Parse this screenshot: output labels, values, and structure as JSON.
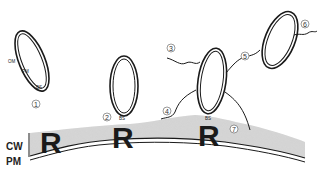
{
  "diagram": {
    "type": "biological schematic",
    "layers": {
      "cell_wall_label": "CW",
      "plasma_membrane_label": "PM"
    },
    "receptor_label": "R",
    "bacterium_layer_labels": {
      "outer_membrane": "OM",
      "plasma_membrane": "PM",
      "binding_site": "BS"
    },
    "binding_site_label": "BS",
    "stage_numbers": [
      "1",
      "2",
      "3",
      "4",
      "5",
      "6",
      "7"
    ],
    "stages": [
      {
        "number": "1",
        "description": "free bacterium with OM, PM, BS labelled"
      },
      {
        "number": "2",
        "description": "bacterium attached to receptor via binding site"
      },
      {
        "number": "3",
        "description": "fibril extending from attached bacterium"
      },
      {
        "number": "4",
        "description": "fibril anchoring to cell wall surface"
      },
      {
        "number": "5",
        "description": "fibril linking two bacteria"
      },
      {
        "number": "6",
        "description": "fibril from secondary bacterium"
      },
      {
        "number": "7",
        "description": "fibril contacting cell wall"
      }
    ],
    "colors": {
      "cell_wall_fill": "#d4d4d4",
      "outline": "#1a1a1a",
      "background": "#ffffff"
    }
  }
}
